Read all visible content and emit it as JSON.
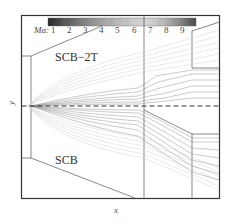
{
  "figure": {
    "type": "flow-field-schematic",
    "colorbar": {
      "label": "Ma:",
      "ticks": [
        "1",
        "2",
        "3",
        "4",
        "5",
        "6",
        "7",
        "8",
        "9"
      ],
      "gradient_colors": [
        "#2a2a2a",
        "#555555",
        "#7a7a7a",
        "#9a9a9a",
        "#b4b4b4",
        "#c8c8c8",
        "#d4d4d4",
        "#bcbcbc",
        "#8c8c8c",
        "#505050"
      ]
    },
    "regions": {
      "upper": "SCB−2T",
      "lower": "SCB"
    },
    "axes": {
      "x_label": "x",
      "y_label": "y"
    },
    "colors": {
      "frame": "#333333",
      "wall": "#555555",
      "streamline": "#8a8a8a",
      "faint_streamline": "#cfcfcf",
      "centerline": "#333333"
    }
  }
}
